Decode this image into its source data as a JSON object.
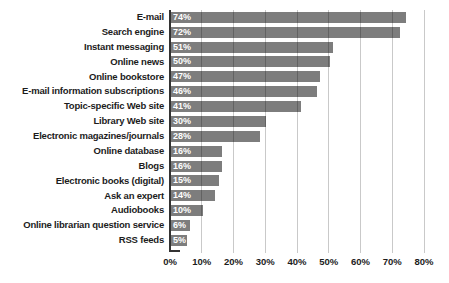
{
  "chart_data": {
    "type": "bar",
    "orientation": "horizontal",
    "title": "",
    "xlabel": "",
    "ylabel": "",
    "categories": [
      "E-mail",
      "Search engine",
      "Instant messaging",
      "Online news",
      "Online bookstore",
      "E-mail information subscriptions",
      "Topic-specific Web site",
      "Library Web site",
      "Electronic magazines/journals",
      "Online database",
      "Blogs",
      "Electronic books (digital)",
      "Ask an expert",
      "Audiobooks",
      "Online librarian question service",
      "RSS feeds"
    ],
    "values": [
      74,
      72,
      51,
      50,
      47,
      46,
      41,
      30,
      28,
      16,
      16,
      15,
      14,
      10,
      6,
      5
    ],
    "value_labels": [
      "74%",
      "72%",
      "51%",
      "50%",
      "47%",
      "46%",
      "41%",
      "30%",
      "28%",
      "16%",
      "16%",
      "15%",
      "14%",
      "10%",
      "6%",
      "5%"
    ],
    "x_ticks": [
      "0%",
      "10%",
      "20%",
      "30%",
      "40%",
      "50%",
      "60%",
      "70%",
      "80%"
    ],
    "xlim": [
      0,
      80
    ],
    "grid": "vertical",
    "legend": "none",
    "colors": {
      "bar": "#7d7d7d",
      "gridline": "#c6c6c6",
      "axis": "#333333",
      "category_text": "#1c1c1c",
      "value_text": "#ffffff",
      "background": "#ffffff"
    }
  }
}
